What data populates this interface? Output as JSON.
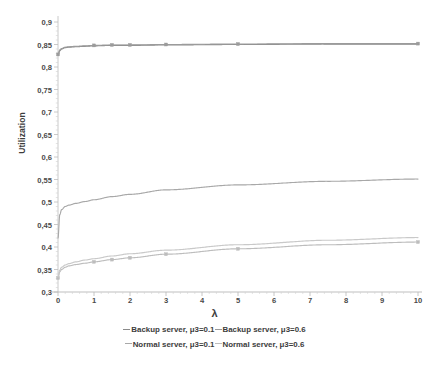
{
  "chart_data": {
    "type": "line",
    "title": "",
    "xlabel": "λ",
    "ylabel": "Utilization",
    "xlim": [
      0,
      10
    ],
    "ylim": [
      0.3,
      0.9
    ],
    "ytick_step": 0.05,
    "grid": false,
    "decimal_separator_axis": ",",
    "legend_position": "bottom",
    "xticks": [
      "0",
      "1",
      "2",
      "3",
      "4",
      "5",
      "6",
      "7",
      "8",
      "9",
      "10"
    ],
    "yticks": [
      "0,3",
      "0,35",
      "0,4",
      "0,45",
      "0,5",
      "0,55",
      "0,6",
      "0,65",
      "0,7",
      "0,75",
      "0,8",
      "0,85",
      "0,9"
    ],
    "x": [
      0,
      0.05,
      0.1,
      0.2,
      0.3,
      0.5,
      0.75,
      1,
      1.5,
      2,
      3,
      5,
      7.5,
      10
    ],
    "series": [
      {
        "name": "Backup server, μ3=0.1",
        "color": "#8a8a8a",
        "values": [
          0.826,
          0.836,
          0.84,
          0.843,
          0.844,
          0.845,
          0.846,
          0.847,
          0.848,
          0.848,
          0.849,
          0.85,
          0.851,
          0.851
        ]
      },
      {
        "name": "Backup server, μ3=0.6",
        "color": "#9b9b9b",
        "values": [
          0.828,
          0.838,
          0.841,
          0.844,
          0.845,
          0.846,
          0.847,
          0.848,
          0.849,
          0.849,
          0.85,
          0.851,
          0.852,
          0.852
        ]
      },
      {
        "name": "Normal server, μ3=0.1",
        "color": "#a8a8a8",
        "values": [
          0.42,
          0.472,
          0.483,
          0.49,
          0.493,
          0.497,
          0.501,
          0.505,
          0.512,
          0.517,
          0.527,
          0.538,
          0.546,
          0.551
        ]
      },
      {
        "name": "Normal server, μ3=0.6",
        "color": "#bdbdbd",
        "values": [
          0.331,
          0.345,
          0.35,
          0.355,
          0.358,
          0.361,
          0.364,
          0.367,
          0.372,
          0.376,
          0.384,
          0.396,
          0.405,
          0.411
        ]
      },
      {
        "name": "Normal server lower band",
        "color": "#c9c9c9",
        "values": [
          0.333,
          0.349,
          0.355,
          0.36,
          0.363,
          0.367,
          0.371,
          0.374,
          0.38,
          0.385,
          0.393,
          0.405,
          0.415,
          0.421
        ]
      }
    ],
    "markers": {
      "series_with_points": [
        "Backup server, μ3=0.6",
        "Normal server, μ3=0.6"
      ],
      "marker_x": [
        0,
        1,
        1.5,
        2,
        3,
        5,
        10
      ]
    }
  },
  "legend": {
    "row1": [
      {
        "label": "Backup server, μ3=0.1"
      },
      {
        "label": "Backup server, μ3=0.6"
      }
    ],
    "row2": [
      {
        "label": "Normal server, μ3=0.1"
      },
      {
        "label": "Normal server, μ3=0.6"
      }
    ]
  },
  "axes": {
    "ylabel": "Utilization",
    "xlabel": "λ"
  }
}
